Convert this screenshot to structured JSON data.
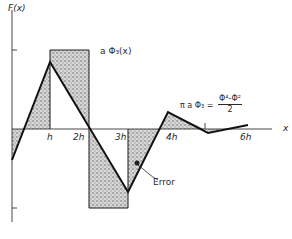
{
  "figure": {
    "y_axis_label": "F(x)",
    "x_axis_label": "x",
    "x_ticks": [
      "h",
      "2h",
      "3h",
      "4h",
      "6h"
    ],
    "function_label": "a Φ₃(x)",
    "equation": {
      "lhs": "π a Φ₃ =",
      "numerator": "Φ⁴-Φ²",
      "denominator": "2"
    },
    "annotation": "Error",
    "colors": {
      "line": "#1a1a1a",
      "shade": "#9a9a9a",
      "background": "#ffffff"
    }
  }
}
